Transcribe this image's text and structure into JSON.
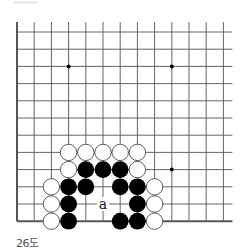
{
  "diagram": {
    "caption": "26도",
    "board": {
      "columns": 13,
      "rows": 12,
      "x0": 17,
      "y0": 32,
      "spacing": 17.2,
      "edges": {
        "left": true,
        "bottom": true,
        "top": false,
        "right": false
      },
      "star_points": [
        [
          3,
          2
        ],
        [
          9,
          2
        ],
        [
          9,
          8
        ]
      ],
      "stones": {
        "white": [
          [
            3,
            7
          ],
          [
            4,
            7
          ],
          [
            5,
            7
          ],
          [
            6,
            7
          ],
          [
            7,
            7
          ],
          [
            3,
            8
          ],
          [
            7,
            8
          ],
          [
            2,
            9
          ],
          [
            8,
            9
          ],
          [
            2,
            10
          ],
          [
            8,
            10
          ],
          [
            2,
            11
          ],
          [
            8,
            11
          ]
        ],
        "black": [
          [
            4,
            8
          ],
          [
            5,
            8
          ],
          [
            6,
            8
          ],
          [
            3,
            9
          ],
          [
            4,
            9
          ],
          [
            6,
            9
          ],
          [
            7,
            9
          ],
          [
            3,
            10
          ],
          [
            7,
            10
          ],
          [
            3,
            11
          ],
          [
            6,
            11
          ],
          [
            7,
            11
          ]
        ]
      },
      "labels": [
        {
          "text": "a",
          "col": 5,
          "row": 10
        }
      ]
    },
    "colors": {
      "line": "#555555",
      "black_stone": "#000000",
      "white_stone": "#ffffff",
      "stone_outline": "#333333"
    }
  }
}
